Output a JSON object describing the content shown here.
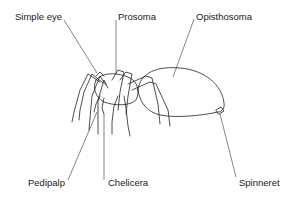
{
  "diagram": {
    "labels": {
      "simple_eye": "Simple eye",
      "prosoma": "Prosoma",
      "opisthosoma": "Opisthosoma",
      "pedipalp": "Pedipalp",
      "chelicera": "Chelicera",
      "spinneret": "Spinneret"
    },
    "colors": {
      "line": "#222222",
      "background": "#ffffff"
    }
  }
}
